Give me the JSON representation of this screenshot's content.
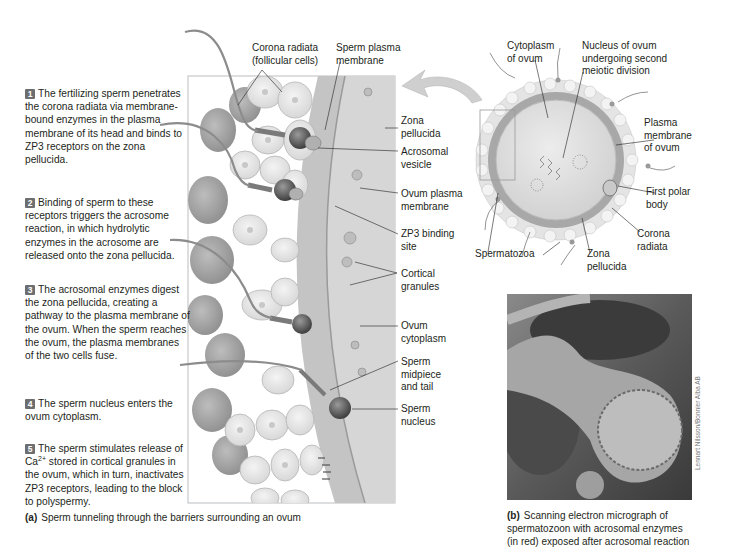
{
  "figure_a": {
    "steps": [
      {
        "num": "1",
        "text": "The fertilizing sperm penetrates the corona radiata via membrane-bound enzymes in the plasma membrane of its head and binds to ZP3 receptors on the zona pellucida."
      },
      {
        "num": "2",
        "text": "Binding of sperm to these receptors triggers the acrosome reaction, in which hydrolytic enzymes in the acrosome are released onto the zona pellucida."
      },
      {
        "num": "3",
        "text": "The acrosomal enzymes digest the zona pellucida, creating a pathway to the plasma membrane of the ovum. When the sperm reaches the ovum, the plasma membranes of the two cells fuse."
      },
      {
        "num": "4",
        "text": "The sperm nucleus enters the ovum cytoplasm."
      },
      {
        "num": "5",
        "text_pre": "The sperm stimulates release of Ca",
        "text_sup": "2+",
        "text_post": " stored in cortical granules in the ovum, which in turn, inactivates ZP3 receptors, leading to the block to polyspermy."
      }
    ],
    "labels": {
      "corona_radiata": "Corona radiata",
      "follicular_cells": "(follicular cells)",
      "sperm_plasma_membrane_1": "Sperm plasma",
      "sperm_plasma_membrane_2": "membrane",
      "zona_pellucida_1": "Zona",
      "zona_pellucida_2": "pellucida",
      "acrosomal_vesicle_1": "Acrosomal",
      "acrosomal_vesicle_2": "vesicle",
      "ovum_plasma_membrane_1": "Ovum plasma",
      "ovum_plasma_membrane_2": "membrane",
      "zp3_binding_site_1": "ZP3 binding",
      "zp3_binding_site_2": "site",
      "cortical_granules_1": "Cortical",
      "cortical_granules_2": "granules",
      "ovum_cytoplasm_1": "Ovum",
      "ovum_cytoplasm_2": "cytoplasm",
      "sperm_midpiece_1": "Sperm",
      "sperm_midpiece_2": "midpiece",
      "sperm_midpiece_3": "and tail",
      "sperm_nucleus_1": "Sperm",
      "sperm_nucleus_2": "nucleus"
    },
    "caption_letter": "(a)",
    "caption_text": "Sperm tunneling through the barriers surrounding an ovum"
  },
  "oocyte": {
    "labels": {
      "cytoplasm_1": "Cytoplasm",
      "cytoplasm_2": "of ovum",
      "nucleus_1": "Nucleus of ovum",
      "nucleus_2": "undergoing second",
      "nucleus_3": "meiotic division",
      "plasma_membrane_1": "Plasma",
      "plasma_membrane_2": "membrane",
      "plasma_membrane_3": "of ovum",
      "polar_body_1": "First polar",
      "polar_body_2": "body",
      "corona_1": "Corona",
      "corona_2": "radiata",
      "spermatozoa": "Spermatozoa",
      "zona_1": "Zona",
      "zona_2": "pellucida"
    }
  },
  "figure_b": {
    "caption_letter": "(b)",
    "caption_line1": "Scanning electron micrograph of",
    "caption_line2": "spermatozoon with acrosomal enzymes",
    "caption_line3": "(in red) exposed after acrosomal reaction",
    "credit": "Lennart Nilsson/Bonnier Alba AB"
  },
  "colors": {
    "badge": "#6d6e70",
    "text": "#231f20",
    "box_border": "#bcbec0"
  }
}
